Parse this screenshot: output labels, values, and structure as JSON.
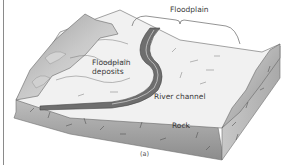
{
  "diagram": {
    "labels": {
      "floodplain": "Floodplain",
      "floodplain_deposits": "Floodplain deposits",
      "river_channel": "River channel",
      "rock": "Rock",
      "caption": "(a)"
    },
    "colors": {
      "background": "#ffffff",
      "surface_light": "#f2f2f2",
      "ridge": "#a8a8a8",
      "block_side_front": "#9a9a9a",
      "block_side_right": "#b8b8b8",
      "river": "#6e6e6e",
      "line": "#555555"
    }
  }
}
